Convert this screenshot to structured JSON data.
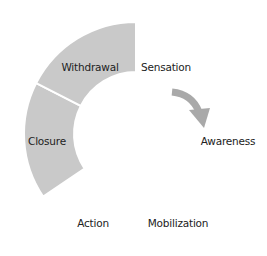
{
  "diagram": {
    "type": "cycle-ring",
    "center": [
      136,
      134
    ],
    "outer_radius": 112,
    "inner_radius": 62,
    "colors": {
      "filled": "#c9c9c9",
      "empty": "#ffffff",
      "separator": "#ffffff",
      "arrow": "#a9a9a9",
      "text": "#222222"
    },
    "segments": [
      {
        "label": "Sensation",
        "start": -90,
        "end": -30,
        "filled": false,
        "pos": [
          166,
          67
        ]
      },
      {
        "label": "Awareness",
        "start": -30,
        "end": 30,
        "filled": false,
        "pos": [
          228,
          141
        ]
      },
      {
        "label": "Mobilization",
        "start": 30,
        "end": 90,
        "filled": false,
        "pos": [
          178,
          223
        ]
      },
      {
        "label": "Action",
        "start": 90,
        "end": 146,
        "filled": false,
        "pos": [
          93,
          223
        ]
      },
      {
        "label": "Closure",
        "start": 146,
        "end": 207,
        "filled": true,
        "pos": [
          47,
          141
        ]
      },
      {
        "label": "Withdrawal",
        "start": 207,
        "end": 270,
        "filled": true,
        "pos": [
          90,
          67
        ]
      }
    ],
    "arrow": {
      "from": "Sensation",
      "to": "Awareness",
      "direction": "clockwise"
    }
  }
}
